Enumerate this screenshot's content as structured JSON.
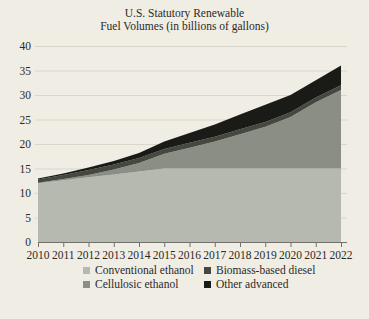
{
  "title": {
    "line1": "U.S. Statutory Renewable",
    "line2": "Fuel Volumes (in billions of gallons)"
  },
  "colors": {
    "background": "#f0ede5",
    "text": "#2b2a25",
    "grid": "#d9d6ca",
    "axis": "#71706a"
  },
  "chart_data": {
    "type": "area",
    "stacked": true,
    "title": "U.S. Statutory Renewable Fuel Volumes (in billions of gallons)",
    "xlabel": "",
    "ylabel": "",
    "x": [
      2010,
      2011,
      2012,
      2013,
      2014,
      2015,
      2016,
      2017,
      2018,
      2019,
      2020,
      2021,
      2022
    ],
    "series": [
      {
        "name": "Conventional ethanol",
        "color": "#b6b9b0",
        "values": [
          12.0,
          12.6,
          13.2,
          13.8,
          14.4,
          15.0,
          15.0,
          15.0,
          15.0,
          15.0,
          15.0,
          15.0,
          15.0
        ]
      },
      {
        "name": "Cellulosic ethanol",
        "color": "#8a8e85",
        "values": [
          0.1,
          0.25,
          0.5,
          1.0,
          1.75,
          3.0,
          4.25,
          5.5,
          7.0,
          8.5,
          10.5,
          13.5,
          16.0
        ]
      },
      {
        "name": "Biomass-based diesel",
        "color": "#45483f",
        "values": [
          0.65,
          0.8,
          1.0,
          1.0,
          1.0,
          1.0,
          1.0,
          1.0,
          1.0,
          1.0,
          1.0,
          1.0,
          1.0
        ]
      },
      {
        "name": "Other advanced",
        "color": "#1a1a17",
        "values": [
          0.2,
          0.3,
          0.5,
          0.75,
          1.0,
          1.5,
          2.0,
          2.5,
          3.0,
          3.5,
          3.5,
          3.5,
          4.0
        ]
      }
    ],
    "totals": [
      12.95,
      13.95,
      15.2,
      16.55,
      18.15,
      20.5,
      22.25,
      24.0,
      26.0,
      28.0,
      30.0,
      33.0,
      36.0
    ],
    "ylim": [
      0,
      40
    ],
    "yticks": [
      0,
      5,
      10,
      15,
      20,
      25,
      30,
      35,
      40
    ],
    "grid": true,
    "legend_position": "bottom",
    "legend_display_order": [
      0,
      2,
      1,
      3
    ]
  }
}
